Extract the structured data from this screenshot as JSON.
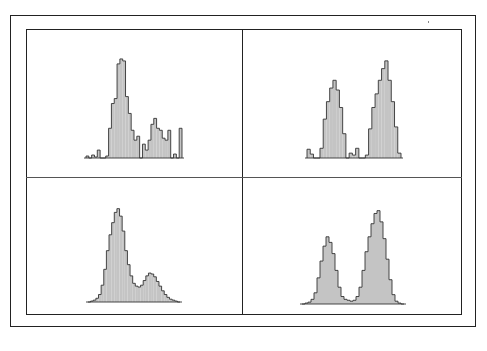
{
  "figure": {
    "layout": "2x2 grid of histograms inside a double-ruled frame",
    "colors": {
      "fill": "#c4c4c4",
      "stroke": "#333333",
      "frame": "#222222",
      "background": "#ffffff"
    }
  },
  "chart_data": [
    {
      "type": "bar",
      "panel": "top-left",
      "title": "",
      "xlabel": "",
      "ylabel": "",
      "grid": false,
      "description": "Noisy histogram: tall dominant peak with a smaller ragged secondary cluster to the right and isolated sparse bars",
      "values": [
        2,
        0,
        3,
        1,
        8,
        0,
        0,
        2,
        30,
        55,
        60,
        95,
        100,
        98,
        62,
        45,
        28,
        18,
        22,
        0,
        14,
        8,
        18,
        34,
        40,
        30,
        28,
        20,
        18,
        28,
        0,
        4,
        0,
        30
      ],
      "ylim": [
        0,
        105
      ]
    },
    {
      "type": "bar",
      "panel": "top-right",
      "title": "",
      "xlabel": "",
      "ylabel": "",
      "grid": false,
      "description": "Bimodal histogram with sparse bars: left peak smaller than right peak, near-empty gap between",
      "values": [
        9,
        4,
        0,
        0,
        10,
        40,
        58,
        72,
        80,
        70,
        52,
        25,
        0,
        5,
        3,
        10,
        0,
        0,
        3,
        30,
        52,
        66,
        80,
        92,
        100,
        80,
        58,
        32,
        5
      ],
      "ylim": [
        0,
        105
      ]
    },
    {
      "type": "bar",
      "panel": "bottom-left",
      "title": "",
      "xlabel": "",
      "ylabel": "",
      "grid": false,
      "description": "Smoothed histogram: dominant tall left peak, shallow valley, lower secondary hump on the right with a tapering tail",
      "values": [
        0,
        1,
        2,
        4,
        8,
        18,
        35,
        55,
        72,
        85,
        96,
        100,
        92,
        76,
        55,
        40,
        28,
        20,
        17,
        16,
        18,
        23,
        28,
        31,
        30,
        27,
        22,
        17,
        12,
        8,
        5,
        3,
        2,
        1,
        0
      ],
      "ylim": [
        0,
        105
      ]
    },
    {
      "type": "bar",
      "panel": "bottom-right",
      "title": "",
      "xlabel": "",
      "ylabel": "",
      "grid": false,
      "description": "Smoothed bimodal histogram: left peak ~2/3 the height of the right peak, deep valley near baseline between",
      "values": [
        0,
        1,
        2,
        5,
        12,
        28,
        46,
        62,
        72,
        66,
        54,
        36,
        18,
        8,
        5,
        4,
        3,
        4,
        8,
        18,
        36,
        56,
        72,
        86,
        97,
        100,
        88,
        70,
        48,
        26,
        10,
        3,
        1,
        0
      ],
      "ylim": [
        0,
        105
      ]
    }
  ]
}
